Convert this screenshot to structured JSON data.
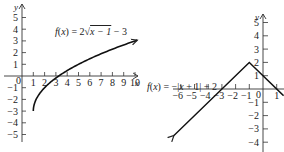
{
  "chart_data": [
    {
      "type": "line",
      "title": "",
      "formula_parts": [
        "f",
        "(",
        "x",
        ") = 2",
        "x",
        " − 1",
        " − 3"
      ],
      "formula_text": "f(x) = 2√(x − 1) − 3",
      "function": "2*sqrt(x-1)-3",
      "xlabel": "x",
      "ylabel": "y",
      "xlim": [
        0,
        10.5
      ],
      "ylim": [
        -5,
        5.5
      ],
      "x_ticks": [
        1,
        2,
        3,
        4,
        5,
        6,
        7,
        8,
        9,
        10
      ],
      "y_ticks": [
        5,
        4,
        3,
        2,
        1,
        -1,
        -2,
        -3,
        -4,
        -5
      ],
      "origin_label": "0",
      "domain": [
        1,
        10.2
      ],
      "start_point": {
        "x": 1,
        "y": -3
      },
      "end_arrow": true,
      "points": [
        {
          "x": 1,
          "y": -3
        },
        {
          "x": 2,
          "y": -1
        },
        {
          "x": 3.25,
          "y": 0
        },
        {
          "x": 5,
          "y": 1
        },
        {
          "x": 10,
          "y": 3
        }
      ],
      "grid": false
    },
    {
      "type": "line",
      "title": "",
      "formula_text": "f(x) = −|x + 1| + 2",
      "function": "-abs(x+1)+2",
      "xlabel": "x",
      "ylabel": "y",
      "xlim": [
        -7,
        1.5
      ],
      "ylim": [
        -4.5,
        5.5
      ],
      "x_ticks": [
        -6,
        -5,
        -4,
        -3,
        -2,
        -1,
        1
      ],
      "y_ticks": [
        5,
        4,
        3,
        2,
        1,
        -1,
        -2,
        -3,
        -4
      ],
      "origin_label": "0",
      "vertex": {
        "x": -1,
        "y": 2
      },
      "domain": [
        -6.5,
        1.5
      ],
      "both_ends_arrow": true,
      "points": [
        {
          "x": -6.5,
          "y": -3.5
        },
        {
          "x": -3,
          "y": 0
        },
        {
          "x": -1,
          "y": 2
        },
        {
          "x": 1,
          "y": 0
        },
        {
          "x": 1.5,
          "y": -0.5
        }
      ],
      "grid": false
    }
  ]
}
